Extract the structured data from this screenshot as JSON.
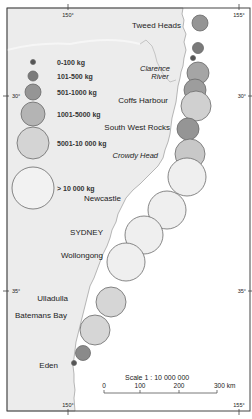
{
  "map": {
    "frame": {
      "x": 7,
      "y": 8,
      "w": 243,
      "h": 403
    },
    "colors": {
      "land": "#ececec",
      "ocean": "#ffffff",
      "frame": "#444444",
      "coast": "#9a9a9a"
    },
    "graticule": {
      "top_ticks": [
        {
          "label": "150°",
          "x": 68
        },
        {
          "label": "155°",
          "x": 239
        }
      ],
      "bottom_ticks": [
        {
          "label": "150°",
          "x": 68
        },
        {
          "label": "155°",
          "x": 239
        }
      ],
      "left_ticks": [
        {
          "label": "30°",
          "y": 96
        },
        {
          "label": "35°",
          "y": 291
        }
      ],
      "right_ticks": [
        {
          "label": "30°",
          "y": 96
        },
        {
          "label": "35°",
          "y": 291
        }
      ]
    },
    "places": [
      {
        "name": "Tweed Heads",
        "x": 181,
        "y": 28,
        "italic": false,
        "anchor": "end"
      },
      {
        "name": "Clarence",
        "x": 155,
        "y": 71,
        "italic": true,
        "anchor": "middle"
      },
      {
        "name": "River",
        "x": 160,
        "y": 79,
        "italic": true,
        "anchor": "middle"
      },
      {
        "name": "Coffs Harbour",
        "x": 168,
        "y": 103,
        "italic": false,
        "anchor": "end"
      },
      {
        "name": "South West Rocks",
        "x": 170,
        "y": 130,
        "italic": false,
        "anchor": "end"
      },
      {
        "name": "Crowdy Head",
        "x": 158,
        "y": 158,
        "italic": true,
        "anchor": "end"
      },
      {
        "name": "Newcastle",
        "x": 121,
        "y": 201,
        "italic": false,
        "anchor": "end"
      },
      {
        "name": "SYDNEY",
        "x": 103,
        "y": 235,
        "italic": false,
        "anchor": "end"
      },
      {
        "name": "Wollongong",
        "x": 103,
        "y": 258,
        "italic": false,
        "anchor": "end"
      },
      {
        "name": "Ulladulla",
        "x": 68,
        "y": 301,
        "italic": false,
        "anchor": "end"
      },
      {
        "name": "Batemans Bay",
        "x": 67,
        "y": 318,
        "italic": false,
        "anchor": "end"
      },
      {
        "name": "Eden",
        "x": 58,
        "y": 368,
        "italic": false,
        "anchor": "end"
      }
    ],
    "legend": {
      "items": [
        {
          "label": "0-100 kg",
          "cy": 62,
          "r": 2.5,
          "fill": "#555555"
        },
        {
          "label": "101-500 kg",
          "cy": 76,
          "r": 5,
          "fill": "#7a7a7a"
        },
        {
          "label": "501-1000 kg",
          "cy": 92,
          "r": 8,
          "fill": "#959595"
        },
        {
          "label": "1001-5000 kg",
          "cy": 114,
          "r": 12,
          "fill": "#b4b4b4"
        },
        {
          "label": "5001-10 000 kg",
          "cy": 143,
          "r": 16,
          "fill": "#d4d4d4"
        },
        {
          "label": "> 10 000 kg",
          "cy": 188,
          "r": 21,
          "fill": "#f2f2f2"
        }
      ],
      "cx": 33,
      "label_x": 57
    },
    "catch_circles": [
      {
        "cx": 200,
        "cy": 23,
        "r": 8,
        "fill": "#959595"
      },
      {
        "cx": 198,
        "cy": 48,
        "r": 5.5,
        "fill": "#7a7a7a"
      },
      {
        "cx": 193,
        "cy": 58,
        "r": 2.5,
        "fill": "#555555"
      },
      {
        "cx": 198,
        "cy": 73,
        "r": 11,
        "fill": "#a5a5a5"
      },
      {
        "cx": 195,
        "cy": 90,
        "r": 11,
        "fill": "#9d9d9d"
      },
      {
        "cx": 196,
        "cy": 106,
        "r": 15,
        "fill": "#d0d0d0"
      },
      {
        "cx": 188,
        "cy": 129,
        "r": 11,
        "fill": "#959595"
      },
      {
        "cx": 190,
        "cy": 154,
        "r": 15,
        "fill": "#c8c8c8"
      },
      {
        "cx": 187,
        "cy": 177,
        "r": 19,
        "fill": "#efefef"
      },
      {
        "cx": 167,
        "cy": 210,
        "r": 19,
        "fill": "#efefef"
      },
      {
        "cx": 144,
        "cy": 235,
        "r": 19,
        "fill": "#efefef"
      },
      {
        "cx": 126,
        "cy": 262,
        "r": 19,
        "fill": "#efefef"
      },
      {
        "cx": 111,
        "cy": 302,
        "r": 15,
        "fill": "#d6d6d6"
      },
      {
        "cx": 95,
        "cy": 330,
        "r": 15,
        "fill": "#d6d6d6"
      },
      {
        "cx": 83,
        "cy": 353,
        "r": 7.5,
        "fill": "#8a8a8a"
      },
      {
        "cx": 74,
        "cy": 363,
        "r": 2.5,
        "fill": "#555555"
      }
    ],
    "scale": {
      "title": "Scale 1 : 10 000 000",
      "ticks": [
        {
          "label": "0",
          "x": 104
        },
        {
          "label": "100",
          "x": 140
        },
        {
          "label": "200",
          "x": 179
        },
        {
          "label": "300 km",
          "x": 217
        }
      ],
      "bar_y": 393,
      "title_x": 125,
      "title_y": 380
    }
  }
}
